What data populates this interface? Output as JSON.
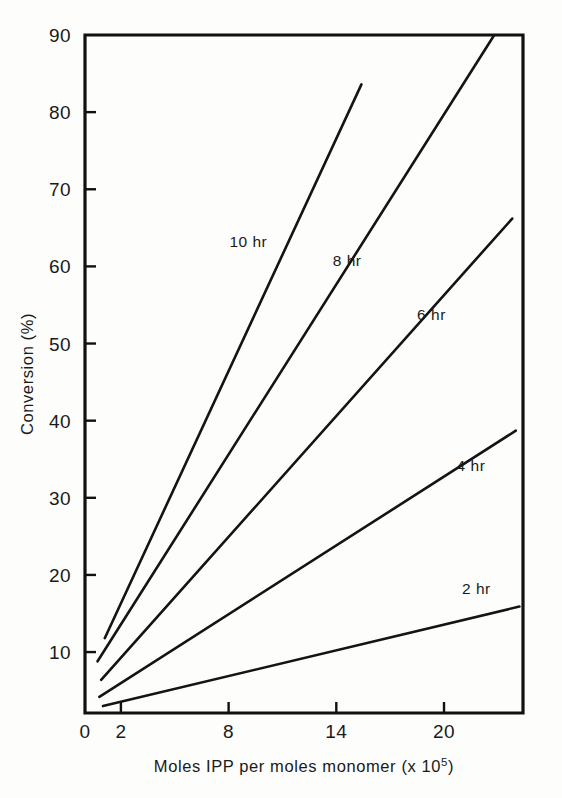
{
  "figure": {
    "background_color": "#fdfdfc",
    "line_color": "#141414",
    "axis_color": "#111111"
  },
  "chart_data": {
    "type": "line",
    "title": "",
    "xlabel_parts": {
      "main": "Moles IPP per moles monomer (x 10",
      "exponent": "5",
      "tail": ")"
    },
    "xlabel": "Moles IPP per moles monomer (x 10^5)",
    "ylabel": "Conversion (%)",
    "xlim": [
      0,
      24.4
    ],
    "ylim": [
      2.1,
      90
    ],
    "xticks": [
      0,
      2,
      8,
      14,
      20
    ],
    "xtick_labels": [
      "0",
      "2",
      "8",
      "14",
      "20"
    ],
    "yticks": [
      10,
      20,
      30,
      40,
      50,
      60,
      70,
      80,
      90
    ],
    "ytick_labels": [
      "10",
      "20",
      "30",
      "40",
      "50",
      "60",
      "70",
      "80",
      "90"
    ],
    "grid": false,
    "legend_position": "inline-labels",
    "series": [
      {
        "name": "10 hr",
        "label": "10 hr",
        "x": [
          1.1,
          15.4
        ],
        "y": [
          11.8,
          83.6
        ],
        "label_x": 9.1,
        "label_y": 62.5
      },
      {
        "name": "8 hr",
        "label": "8 hr",
        "x": [
          0.7,
          22.8
        ],
        "y": [
          8.8,
          90.0
        ],
        "label_x": 14.6,
        "label_y": 60.0
      },
      {
        "name": "6 hr",
        "label": "6 hr",
        "x": [
          0.9,
          23.8
        ],
        "y": [
          6.4,
          66.2
        ],
        "label_x": 19.3,
        "label_y": 53.0
      },
      {
        "name": "4 hr",
        "label": "4 hr",
        "x": [
          0.8,
          24.0
        ],
        "y": [
          4.2,
          38.7
        ],
        "label_x": 21.5,
        "label_y": 33.5
      },
      {
        "name": "2 hr",
        "label": "2 hr",
        "x": [
          1.0,
          24.2
        ],
        "y": [
          3.0,
          15.9
        ],
        "label_x": 21.8,
        "label_y": 17.5
      }
    ]
  }
}
